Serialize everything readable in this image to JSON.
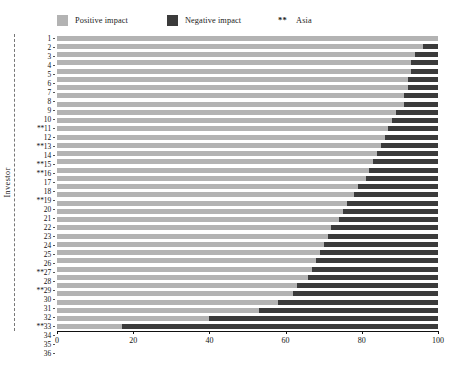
{
  "legend": {
    "positive": {
      "label": "Positive impact",
      "color": "#b3b3b3",
      "icon": "square-swatch"
    },
    "negative": {
      "label": "Negative impact",
      "color": "#3b3b3b",
      "icon": "square-swatch"
    },
    "asia": {
      "marker": "**",
      "label": "Asia"
    }
  },
  "axes": {
    "ylabel": "Investor",
    "xlabel": "",
    "xticks": [
      "0",
      "20",
      "40",
      "60",
      "80",
      "100"
    ],
    "xlim": [
      0,
      100
    ]
  },
  "chart_data": {
    "type": "bar",
    "orientation": "horizontal",
    "stacked": true,
    "title": "",
    "xlabel": "",
    "ylabel": "Investor",
    "xlim": [
      0,
      100
    ],
    "xticks": [
      0,
      20,
      40,
      60,
      80,
      100
    ],
    "grid": false,
    "legend_position": "top",
    "categories": [
      "1",
      "2",
      "3",
      "4",
      "5",
      "6",
      "7",
      "8",
      "9",
      "10",
      "**11",
      "12",
      "**13",
      "14",
      "**15",
      "**16",
      "17",
      "18",
      "**19",
      "20",
      "21",
      "22",
      "23",
      "24",
      "25",
      "26",
      "**27",
      "28",
      "**29",
      "30",
      "31",
      "32",
      "**33",
      "34",
      "35",
      "36"
    ],
    "asia_flagged": [
      "11",
      "13",
      "15",
      "16",
      "19",
      "27",
      "29",
      "33"
    ],
    "series": [
      {
        "name": "Positive impact",
        "color": "#b3b3b3",
        "values": [
          100,
          96,
          94,
          93,
          93,
          92,
          92,
          91,
          91,
          89,
          88,
          87,
          86,
          85,
          84,
          83,
          82,
          81,
          79,
          78,
          76,
          75,
          74,
          72,
          71,
          70,
          69,
          68,
          67,
          66,
          63,
          62,
          58,
          53,
          40,
          17
        ]
      },
      {
        "name": "Negative impact",
        "color": "#3b3b3b",
        "values": [
          0,
          4,
          6,
          7,
          7,
          8,
          8,
          9,
          9,
          11,
          12,
          13,
          14,
          15,
          16,
          17,
          18,
          19,
          21,
          22,
          24,
          25,
          26,
          28,
          29,
          30,
          31,
          32,
          33,
          34,
          37,
          38,
          42,
          47,
          60,
          83
        ]
      }
    ]
  }
}
